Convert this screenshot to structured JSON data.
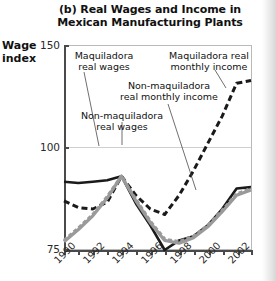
{
  "title": "(b) Real Wages and Income in Mexican Manufacturing Plants",
  "title_line1": "(b) Real Wages and Income in",
  "title_line2": "Mexican Manufacturing Plants",
  "ylabel_line1": "Wage",
  "ylabel_line2": "index",
  "annotations": {
    "maquiladora_real_wages_l1": "Maquiladora",
    "maquiladora_real_wages_l2": "real wages",
    "maquiladora_income_l1": "Maquiladora real",
    "maquiladora_income_l2": "monthly income",
    "nonmaquiladora_income_l1": "Non-maquiladora",
    "nonmaquiladora_income_l2": "real monthly income",
    "nonmaquiladora_wages_l1": "Non-maquiladora",
    "nonmaquiladora_wages_l2": "real wages"
  },
  "colors": {
    "black": "#1a1a1a",
    "gray": "#9a9a9a",
    "axis": "#4a4a4a",
    "grid": "#cfcfcf",
    "border": "#b9b9b9",
    "text": "#111111"
  },
  "chart_data": {
    "type": "line",
    "title": "(b) Real Wages and Income in Mexican Manufacturing Plants",
    "xlabel": "",
    "ylabel": "Wage index",
    "xlim": [
      1990,
      2003
    ],
    "ylim": [
      75,
      150
    ],
    "yticks": [
      75,
      100,
      150
    ],
    "ytick_labels": [
      "75",
      "100",
      "150"
    ],
    "xticks": [
      1990,
      1991,
      1992,
      1993,
      1994,
      1995,
      1996,
      1997,
      1998,
      1999,
      2000,
      2001,
      2002,
      2003
    ],
    "xtick_labels": [
      "1990",
      "",
      "1992",
      "",
      "1994",
      "",
      "1996",
      "",
      "1998",
      "",
      "2000",
      "",
      "2002",
      ""
    ],
    "grid": false,
    "gridline_at": 100,
    "legend": "annotated-inline",
    "x": [
      1990,
      1991,
      1992,
      1993,
      1994,
      1995,
      1996,
      1997,
      1998,
      1999,
      2000,
      2001,
      2002,
      2003
    ],
    "series": [
      {
        "name": "Maquiladora real wages",
        "style": "solid",
        "color": "#1a1a1a",
        "width": 2.6,
        "values": [
          100.0,
          99.5,
          100.0,
          100.5,
          102.0,
          92.0,
          84.0,
          75.0,
          78.5,
          80.0,
          84.0,
          90.0,
          97.5,
          98.0
        ]
      },
      {
        "name": "Non-maquiladora real wages",
        "style": "solid",
        "color": "#9a9a9a",
        "width": 3.2,
        "values": [
          78.0,
          82.5,
          87.5,
          94.0,
          102.0,
          93.0,
          85.0,
          78.5,
          77.5,
          79.5,
          83.5,
          89.0,
          95.0,
          97.0
        ]
      },
      {
        "name": "Non-maquiladora real monthly income",
        "style": "dashed-gray",
        "color": "#9a9a9a",
        "width": 3.2,
        "values": [
          78.5,
          83.0,
          88.0,
          94.5,
          102.0,
          93.5,
          85.5,
          79.0,
          78.0,
          80.0,
          84.0,
          89.5,
          95.5,
          97.5
        ]
      },
      {
        "name": "Maquiladora real monthly income",
        "style": "dashed",
        "color": "#1a1a1a",
        "width": 3.0,
        "values": [
          93.0,
          90.5,
          90.0,
          92.5,
          102.0,
          95.0,
          90.0,
          88.0,
          95.0,
          104.0,
          114.0,
          124.0,
          136.0,
          137.0
        ]
      }
    ]
  }
}
